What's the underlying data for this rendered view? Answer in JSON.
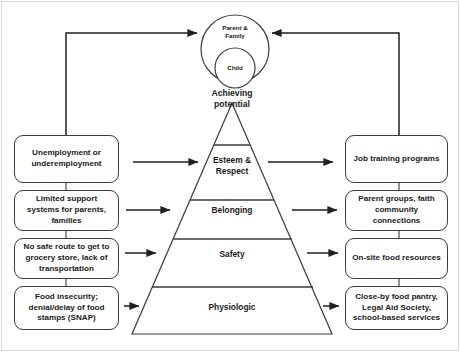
{
  "diagram": {
    "title_center": {
      "outer_circle_label": "Parent &\nFamily",
      "outer_circle_line1": "Parent &",
      "outer_circle_line2": "Family",
      "inner_circle_label": "Child"
    },
    "apex_label_line1": "Achieving",
    "apex_label_line2": "potential",
    "pyramid": {
      "type": "hierarchy-pyramid",
      "levels": [
        {
          "label": "Esteem & Respect",
          "line1": "Esteem &",
          "line2": "Respect"
        },
        {
          "label": "Belonging",
          "line1": "Belonging",
          "line2": ""
        },
        {
          "label": "Safety",
          "line1": "Safety",
          "line2": ""
        },
        {
          "label": "Physiologic",
          "line1": "Physiologic",
          "line2": ""
        }
      ]
    },
    "left_boxes": [
      {
        "text": "Unemployment or underemployment"
      },
      {
        "text": "Limited support systems for parents, families"
      },
      {
        "text": "No safe route to get to grocery store, lack of transportation"
      },
      {
        "text": "Food insecurity; denial/delay of food stamps (SNAP)"
      }
    ],
    "right_boxes": [
      {
        "text": "Job training programs"
      },
      {
        "text": "Parent groups, faith community connections"
      },
      {
        "text": "On-site food resources"
      },
      {
        "text": "Close-by food pantry, Legal Aid Society, school-based services"
      }
    ],
    "colors": {
      "stroke": "#3b3b3b",
      "text": "#1a1a1a",
      "background": "#ffffff",
      "frame": "#d8d8d8"
    }
  }
}
